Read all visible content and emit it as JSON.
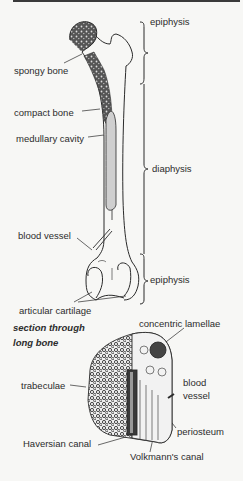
{
  "figure": {
    "labels": {
      "epiphysis_top": "epiphysis",
      "spongy_bone": "spongy bone",
      "compact_bone": "compact bone",
      "medullary_cavity": "medullary cavity",
      "diaphysis": "diaphysis",
      "blood_vessel": "blood vessel",
      "epiphysis_bottom": "epiphysis",
      "articular_cartilage": "articular cartilage",
      "section_title_line1": "section through",
      "section_title_line2": "long bone",
      "concentric_lamellae": "concentric lamellae",
      "trabeculae": "trabeculae",
      "blood_vessel_2_line1": "blood",
      "blood_vessel_2_line2": "vessel",
      "periosteum": "periosteum",
      "haversian_canal": "Haversian canal",
      "volkmanns_canal": "Volkmann's canal"
    },
    "colors": {
      "ink": "#2a2a2a",
      "paper": "#f7f7f5"
    }
  }
}
